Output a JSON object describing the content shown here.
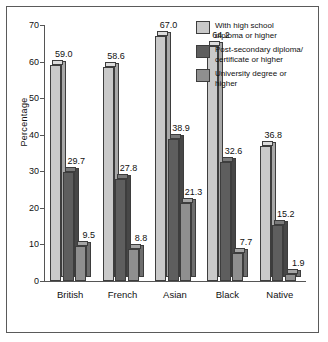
{
  "chart_data": {
    "type": "bar",
    "title": "",
    "xlabel": "",
    "ylabel": "Percentage",
    "ylim": [
      0,
      70
    ],
    "yticks": [
      0,
      10,
      20,
      30,
      40,
      50,
      60,
      70
    ],
    "grid": false,
    "legend_position": "top-right",
    "style": "3d-column",
    "categories": [
      "British",
      "French",
      "Asian",
      "Black",
      "Native"
    ],
    "series": [
      {
        "name": "With high school diploma or higher",
        "color": "#c9c9c9",
        "side_color": "#a8a8a8",
        "top_color": "#dcdcdc",
        "values": [
          59.0,
          58.6,
          67.0,
          64.2,
          36.8
        ],
        "labels": [
          "59.0",
          "58.6",
          "67.0",
          "64.2",
          "36.8"
        ]
      },
      {
        "name": "Post-secondary diploma/certificate or higher",
        "color": "#5e5e5e",
        "side_color": "#474747",
        "top_color": "#7a7a7a",
        "values": [
          29.7,
          27.8,
          38.9,
          32.6,
          15.2
        ],
        "labels": [
          "29.7",
          "27.8",
          "38.9",
          "32.6",
          "15.2"
        ]
      },
      {
        "name": "University degree or higher",
        "color": "#8f8f8f",
        "side_color": "#6e6e6e",
        "top_color": "#a5a5a5",
        "values": [
          9.5,
          8.8,
          21.3,
          7.7,
          1.9
        ],
        "labels": [
          "9.5",
          "8.8",
          "21.3",
          "7.7",
          "1.9"
        ]
      }
    ],
    "legend": [
      {
        "line1": "With high school",
        "line2": "diploma or higher"
      },
      {
        "line1": "Post-secondary diploma/",
        "line2": "certificate or higher"
      },
      {
        "line1": "University degree or",
        "line2": "higher"
      }
    ]
  },
  "frame": {
    "border_color": "#5a5a5a",
    "background": "#ffffff"
  }
}
